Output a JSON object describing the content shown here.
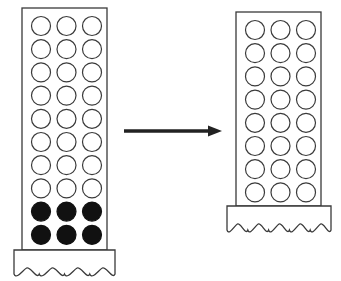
{
  "diagram": {
    "colors": {
      "stroke": "#3a3a3a",
      "fill_dark": "#111111",
      "background": "#ffffff"
    },
    "left_column": {
      "rows": 10,
      "cols": 3,
      "filled_rows": [
        8,
        9
      ],
      "base_bumps": 4
    },
    "arrow": {
      "direction": "right"
    },
    "right_column": {
      "rows": 8,
      "cols": 3,
      "filled_rows": [],
      "base_bumps": 5
    }
  }
}
